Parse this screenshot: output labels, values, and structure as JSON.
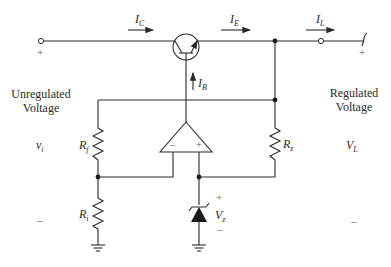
{
  "diagram": {
    "type": "series voltage regulator circuit",
    "currents": {
      "collector": {
        "symbol": "I",
        "sub": "C"
      },
      "emitter": {
        "symbol": "I",
        "sub": "E"
      },
      "load": {
        "symbol": "I",
        "sub": "L"
      },
      "base": {
        "symbol": "I",
        "sub": "B"
      }
    },
    "left": {
      "title_line1": "Unregulated",
      "title_line2": "Voltage",
      "symbol": "v",
      "symbol_sub": "i",
      "plus": "+",
      "minus": "–"
    },
    "right": {
      "title_line1": "Regulated",
      "title_line2": "Voltage",
      "symbol": "V",
      "symbol_sub": "L",
      "plus": "+",
      "minus": "–"
    },
    "components": {
      "rf": {
        "symbol": "R",
        "sub": "f"
      },
      "ri": {
        "symbol": "R",
        "sub": "i"
      },
      "rz": {
        "symbol": "R",
        "sub": "z"
      },
      "vz": {
        "symbol": "V",
        "sub": "z",
        "plus": "+",
        "minus": "–"
      },
      "opamp": {
        "minus": "–",
        "plus": "+"
      }
    }
  }
}
